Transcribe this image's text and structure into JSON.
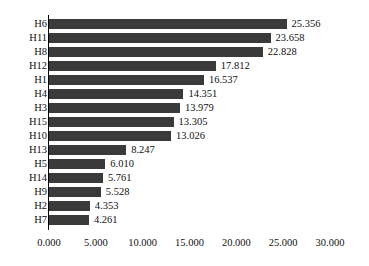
{
  "chart_data": {
    "type": "bar",
    "orientation": "horizontal",
    "title": "",
    "subtitle": "",
    "xlabel": "",
    "ylabel": "",
    "categories": [
      "H6",
      "H11",
      "H8",
      "H12",
      "H1",
      "H4",
      "H3",
      "H15",
      "H10",
      "H13",
      "H5",
      "H14",
      "H9",
      "H2",
      "H7"
    ],
    "values": [
      25.356,
      23.658,
      22.828,
      17.812,
      16.537,
      14.351,
      13.979,
      13.305,
      13.026,
      8.247,
      6.01,
      5.761,
      5.528,
      4.353,
      4.261
    ],
    "value_labels": [
      "25.356",
      "23.658",
      "22.828",
      "17.812",
      "16.537",
      "14.351",
      "13.979",
      "13.305",
      "13.026",
      "8.247",
      "6.010",
      "5.761",
      "5.528",
      "4.353",
      "4.261"
    ],
    "xlim": [
      0,
      30
    ],
    "xticks": [
      0,
      5,
      10,
      15,
      20,
      25,
      30
    ],
    "xtick_labels": [
      "0.000",
      "5.000",
      "10.000",
      "15.000",
      "20.000",
      "25.000",
      "30.000"
    ],
    "grid": false,
    "legend": null,
    "data_labels_shown": true,
    "sorted": "descending",
    "colors": {
      "bar": "#3a3a3a",
      "background": "#ffffff",
      "axis": "#000000",
      "text": "#111111"
    }
  }
}
